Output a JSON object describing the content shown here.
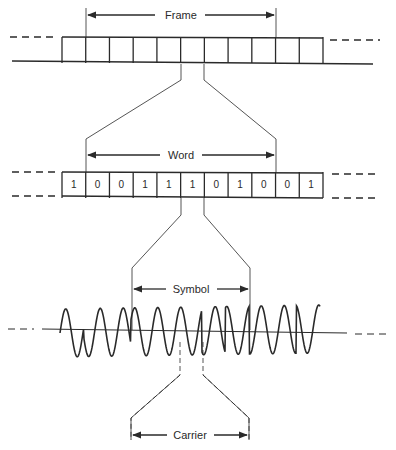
{
  "diagram": {
    "frame": {
      "label": "Frame",
      "cell_count": 11,
      "row": {
        "x0": 62,
        "x1": 323,
        "top": 37,
        "bottom": 62
      },
      "span": {
        "x0": 86,
        "x1": 276,
        "y": 15
      }
    },
    "word": {
      "label": "Word",
      "bits": [
        "1",
        "0",
        "0",
        "1",
        "1",
        "1",
        "0",
        "1",
        "0",
        "0",
        "1"
      ],
      "row": {
        "x0": 62,
        "x1": 323,
        "top": 172,
        "bottom": 197
      },
      "span": {
        "x0": 86,
        "x1": 276,
        "y": 155
      }
    },
    "symbol": {
      "label": "Symbol",
      "span": {
        "x0": 132,
        "x1": 250,
        "y": 289
      }
    },
    "carrier": {
      "label": "Carrier",
      "span": {
        "x0": 131,
        "x1": 249,
        "y": 435
      }
    },
    "waveform": {
      "baseline_y": 333,
      "x0": 60,
      "x1": 320
    }
  }
}
